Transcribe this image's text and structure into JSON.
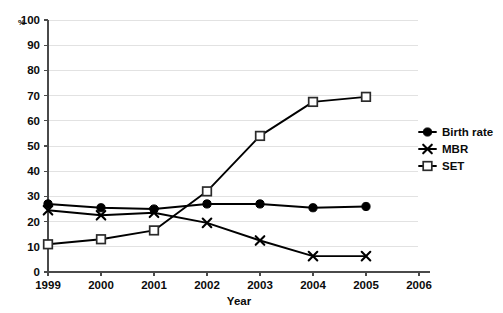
{
  "chart_data": {
    "type": "line",
    "title": "",
    "xlabel": "Year",
    "ylabel": "%",
    "ylim": [
      0,
      100
    ],
    "xlim": [
      1999,
      2006
    ],
    "grid": true,
    "legend_position": "right",
    "x": [
      1999,
      2000,
      2001,
      2002,
      2003,
      2004,
      2005
    ],
    "xtick_labels": [
      "1999",
      "2000",
      "2001",
      "2002",
      "2003",
      "2004",
      "2005",
      "2006"
    ],
    "xtick_values": [
      1999,
      2000,
      2001,
      2002,
      2003,
      2004,
      2005,
      2006
    ],
    "ytick_labels": [
      "0",
      "10",
      "20",
      "30",
      "40",
      "50",
      "60",
      "70",
      "80",
      "90",
      "100"
    ],
    "ytick_values": [
      0,
      10,
      20,
      30,
      40,
      50,
      60,
      70,
      80,
      90,
      100
    ],
    "series": [
      {
        "name": "Birth rate",
        "marker": "filled-circle",
        "values": [
          27,
          25.5,
          25,
          27,
          27,
          25.5,
          26
        ]
      },
      {
        "name": "MBR",
        "marker": "cross",
        "values": [
          24.5,
          22.5,
          23.5,
          19.5,
          12.5,
          6.3,
          6.3
        ]
      },
      {
        "name": "SET",
        "marker": "open-square",
        "values": [
          11,
          13,
          16.5,
          32,
          54,
          67.5,
          69.5
        ]
      }
    ],
    "colors": {
      "line": "#000000",
      "grid": "#e2e2e2",
      "axis": "#4a4a4a",
      "text": "#0b0b0b",
      "background": "#ffffff"
    }
  },
  "axes": {
    "y_unit_label": "%",
    "x_axis_title": "Year"
  },
  "legend": {
    "items": [
      {
        "label": "Birth rate",
        "marker": "filled-circle"
      },
      {
        "label": "MBR",
        "marker": "cross"
      },
      {
        "label": "SET",
        "marker": "open-square"
      }
    ]
  }
}
